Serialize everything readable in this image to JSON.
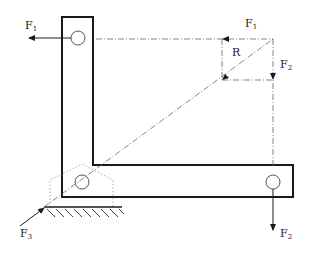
{
  "diagram": {
    "labels": {
      "f1_left": "F",
      "f1_left_sub": "1",
      "f1_top": "F",
      "f1_top_sub": "1",
      "r": "R",
      "f2_right": "F",
      "f2_right_sub": "2",
      "f2_bottom": "F",
      "f2_bottom_sub": "2",
      "f3": "F",
      "f3_sub": "3"
    },
    "colors": {
      "stroke": "#1a1a1a",
      "dash": "#666666",
      "dotted": "#999999"
    }
  }
}
